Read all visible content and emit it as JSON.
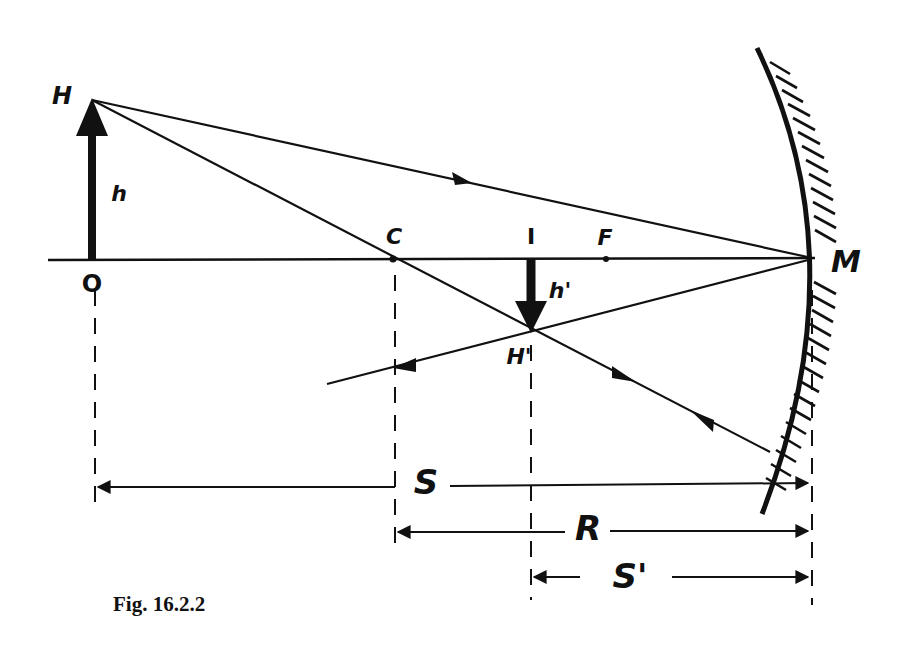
{
  "figure": {
    "caption": "Fig. 16.2.2",
    "type": "concave mirror ray diagram",
    "colors": {
      "ink": "#111111",
      "background": "#ffffff"
    }
  },
  "labels": {
    "object_tip": "H",
    "object_height": "h",
    "object_base": "O",
    "center": "C",
    "image_base": "I",
    "focus": "F",
    "image_height": "h'",
    "image_tip": "H'",
    "mirror_vertex": "M",
    "object_distance": "S",
    "radius": "R",
    "image_distance": "S'"
  },
  "points": {
    "H": [
      92,
      100
    ],
    "O": [
      92,
      259
    ],
    "C": [
      393,
      259
    ],
    "I": [
      531,
      259
    ],
    "F": [
      606,
      259
    ],
    "H_prime": [
      531,
      330
    ],
    "M": [
      812,
      259
    ]
  },
  "dimensions": [
    {
      "name": "S",
      "from": "O",
      "to": "M",
      "y": 487
    },
    {
      "name": "R",
      "from": "C",
      "to": "M",
      "y": 532
    },
    {
      "name": "S'",
      "from": "I",
      "to": "M",
      "y": 578
    }
  ]
}
